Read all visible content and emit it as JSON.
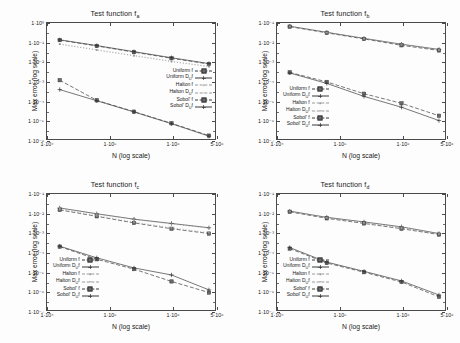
{
  "figure": {
    "background": "#fdfdfd",
    "axis_color": "#4a4a4a",
    "text_color": "#1a1a1a"
  },
  "common": {
    "xlabel": "N (log scale)",
    "ylabel": "Max error (log scale)",
    "xticks": [
      "1·10⁴",
      "1·10⁵",
      "1·10⁶",
      "5·10⁶"
    ],
    "legend_labels": [
      "Uniform f",
      "Uniform Dᵤf",
      "Halton f",
      "Halton Dᵤf",
      "Sobol' f",
      "Sobol' Dᵤf"
    ]
  },
  "chart_data": [
    {
      "id": "panel-a",
      "type": "line",
      "title": "Test function f",
      "title_sub": "a",
      "xlabel": "N (log scale)",
      "ylabel": "Max error (log scale)",
      "xscale": "log",
      "yscale": "log",
      "xlim": [
        10000,
        5000000
      ],
      "ylim": [
        1e-06,
        1
      ],
      "xticks": [
        10000,
        100000,
        1000000,
        5000000
      ],
      "xticklabels": [
        "1·10⁴",
        "1·10⁵",
        "1·10⁶",
        "5·10⁶"
      ],
      "yticks": [
        1,
        0.1,
        0.01,
        0.001,
        0.0001,
        1e-05,
        1e-06
      ],
      "yticklabels": [
        "1·10⁰",
        "1·10⁻¹",
        "1·10⁻²",
        "1·10⁻³",
        "1·10⁻⁴",
        "1·10⁻⁵",
        "1·10⁻⁶"
      ],
      "grid": false,
      "legend_position": "center-right",
      "x": [
        16000,
        63000,
        250000,
        1000000,
        4000000
      ],
      "series": [
        {
          "name": "Uniform f",
          "marker": "square",
          "dash": "4,2",
          "values": [
            0.13,
            0.065,
            0.031,
            0.015,
            0.0075
          ]
        },
        {
          "name": "Uniform Dᵤf",
          "marker": "plus",
          "dash": "none",
          "values": [
            0.135,
            0.068,
            0.033,
            0.016,
            0.008
          ]
        },
        {
          "name": "Halton f",
          "marker": "dot",
          "dash": "1,2",
          "values": [
            0.08,
            0.04,
            0.02,
            0.01,
            0.0055
          ]
        },
        {
          "name": "Halton Dᵤf",
          "marker": "dot",
          "dash": "1,2",
          "values": [
            0.082,
            0.041,
            0.021,
            0.0105,
            0.0057
          ]
        },
        {
          "name": "Sobol' f",
          "marker": "square",
          "dash": "4,2",
          "values": [
            0.0011,
            0.0001,
            2.6e-05,
            6.5e-06,
            1.5e-06
          ]
        },
        {
          "name": "Sobol' Dᵤf",
          "marker": "plus",
          "dash": "none",
          "values": [
            0.00036,
            9.5e-05,
            2.5e-05,
            6.2e-06,
            1.4e-06
          ]
        }
      ]
    },
    {
      "id": "panel-b",
      "type": "line",
      "title": "Test function f",
      "title_sub": "b",
      "xlabel": "N (log scale)",
      "ylabel": "Max error (log scale)",
      "xscale": "log",
      "yscale": "log",
      "xlim": [
        10000,
        5000000
      ],
      "ylim": [
        1e-07,
        0.1
      ],
      "xticks": [
        10000,
        100000,
        1000000,
        5000000
      ],
      "xticklabels": [
        "1·10⁴",
        "1·10⁵",
        "1·10⁶",
        "5·10⁶"
      ],
      "yticks": [
        0.1,
        0.01,
        0.001,
        0.0001,
        1e-05,
        1e-06,
        1e-07
      ],
      "yticklabels": [
        "1·10⁻¹",
        "1·10⁻²",
        "1·10⁻³",
        "1·10⁻⁴",
        "1·10⁻⁵",
        "1·10⁻⁶",
        "1·10⁻⁷"
      ],
      "grid": false,
      "legend_position": "lower-left",
      "x": [
        16000,
        63000,
        250000,
        1000000,
        4000000
      ],
      "series": [
        {
          "name": "Uniform f",
          "marker": "square",
          "dash": "4,2",
          "values": [
            0.065,
            0.031,
            0.015,
            0.007,
            0.0038
          ]
        },
        {
          "name": "Uniform Dᵤf",
          "marker": "plus",
          "dash": "none",
          "values": [
            0.068,
            0.033,
            0.016,
            0.008,
            0.0043
          ]
        },
        {
          "name": "Halton f",
          "marker": "dot",
          "dash": "1,2",
          "values": [
            0.066,
            0.032,
            0.0155,
            0.0075,
            0.004
          ]
        },
        {
          "name": "Halton Dᵤf",
          "marker": "dot",
          "dash": "1,2",
          "values": [
            0.067,
            0.0325,
            0.0158,
            0.0078,
            0.0041
          ]
        },
        {
          "name": "Sobol' f",
          "marker": "square",
          "dash": "4,2",
          "values": [
            0.00028,
            9e-05,
            2.2e-05,
            7e-06,
            1.6e-06
          ]
        },
        {
          "name": "Sobol' Dᵤf",
          "marker": "plus",
          "dash": "none",
          "values": [
            0.00026,
            7.5e-05,
            1.6e-05,
            4.4e-06,
            9e-07
          ]
        }
      ]
    },
    {
      "id": "panel-c",
      "type": "line",
      "title": "Test function f",
      "title_sub": "c",
      "xlabel": "N (log scale)",
      "ylabel": "Max error (log scale)",
      "xscale": "log",
      "yscale": "log",
      "xlim": [
        10000,
        5000000
      ],
      "ylim": [
        1e-07,
        0.1
      ],
      "xticks": [
        10000,
        100000,
        1000000,
        5000000
      ],
      "xticklabels": [
        "1·10⁴",
        "1·10⁵",
        "1·10⁶",
        "5·10⁶"
      ],
      "yticks": [
        0.1,
        0.01,
        0.001,
        0.0001,
        1e-05,
        1e-06,
        1e-07
      ],
      "yticklabels": [
        "1·10⁻¹",
        "1·10⁻²",
        "1·10⁻³",
        "1·10⁻⁴",
        "1·10⁻⁵",
        "1·10⁻⁶",
        "1·10⁻⁷"
      ],
      "grid": false,
      "legend_position": "lower-left",
      "x": [
        16000,
        63000,
        250000,
        1000000,
        4000000
      ],
      "series": [
        {
          "name": "Uniform f",
          "marker": "square",
          "dash": "4,2",
          "values": [
            0.015,
            0.007,
            0.0032,
            0.0016,
            0.0009
          ]
        },
        {
          "name": "Uniform Dᵤf",
          "marker": "plus",
          "dash": "none",
          "values": [
            0.019,
            0.0095,
            0.005,
            0.003,
            0.0018
          ]
        },
        {
          "name": "Halton f",
          "marker": "dot",
          "dash": "1,2",
          "values": [
            0.016,
            0.0075,
            0.0035,
            0.0018,
            0.001
          ]
        },
        {
          "name": "Halton Dᵤf",
          "marker": "dot",
          "dash": "1,2",
          "values": [
            0.0185,
            0.0092,
            0.0048,
            0.0028,
            0.0017
          ]
        },
        {
          "name": "Sobol' f",
          "marker": "square",
          "dash": "4,2",
          "values": [
            0.00019,
            4.2e-05,
            1.3e-05,
            3e-06,
            8e-07
          ]
        },
        {
          "name": "Sobol' Dᵤf",
          "marker": "plus",
          "dash": "none",
          "values": [
            0.0002,
            5e-05,
            1.5e-05,
            6.5e-06,
            1.1e-06
          ]
        }
      ]
    },
    {
      "id": "panel-d",
      "type": "line",
      "title": "Test function f",
      "title_sub": "d",
      "xlabel": "N (log scale)",
      "ylabel": "Max error (log scale)",
      "xscale": "log",
      "yscale": "log",
      "xlim": [
        10000,
        5000000
      ],
      "ylim": [
        1e-07,
        0.1
      ],
      "xticks": [
        10000,
        100000,
        1000000,
        5000000
      ],
      "xticklabels": [
        "1·10⁴",
        "1·10⁵",
        "1·10⁶",
        "5·10⁶"
      ],
      "yticks": [
        0.1,
        0.01,
        0.001,
        0.0001,
        1e-05,
        1e-06,
        1e-07
      ],
      "yticklabels": [
        "1·10⁻¹",
        "1·10⁻²",
        "1·10⁻³",
        "1·10⁻⁴",
        "1·10⁻⁵",
        "1·10⁻⁶",
        "1·10⁻⁷"
      ],
      "grid": false,
      "legend_position": "lower-left",
      "x": [
        16000,
        63000,
        250000,
        1000000,
        4000000
      ],
      "series": [
        {
          "name": "Uniform f",
          "marker": "square",
          "dash": "4,2",
          "values": [
            0.012,
            0.0055,
            0.003,
            0.0016,
            0.0008
          ]
        },
        {
          "name": "Uniform Dᵤf",
          "marker": "plus",
          "dash": "none",
          "values": [
            0.013,
            0.0062,
            0.0036,
            0.002,
            0.0009
          ]
        },
        {
          "name": "Halton f",
          "marker": "dot",
          "dash": "1,2",
          "values": [
            0.0125,
            0.0058,
            0.0032,
            0.0017,
            0.00084
          ]
        },
        {
          "name": "Halton Dᵤf",
          "marker": "dot",
          "dash": "1,2",
          "values": [
            0.0128,
            0.006,
            0.0034,
            0.00185,
            0.00087
          ]
        },
        {
          "name": "Sobol' f",
          "marker": "square",
          "dash": "4,2",
          "values": [
            0.00015,
            2.7e-05,
            9e-06,
            2.8e-06,
            4.8e-07
          ]
        },
        {
          "name": "Sobol' Dᵤf",
          "marker": "plus",
          "dash": "none",
          "values": [
            0.00017,
            3e-05,
            1e-05,
            3.2e-06,
            6e-07
          ]
        }
      ]
    }
  ]
}
